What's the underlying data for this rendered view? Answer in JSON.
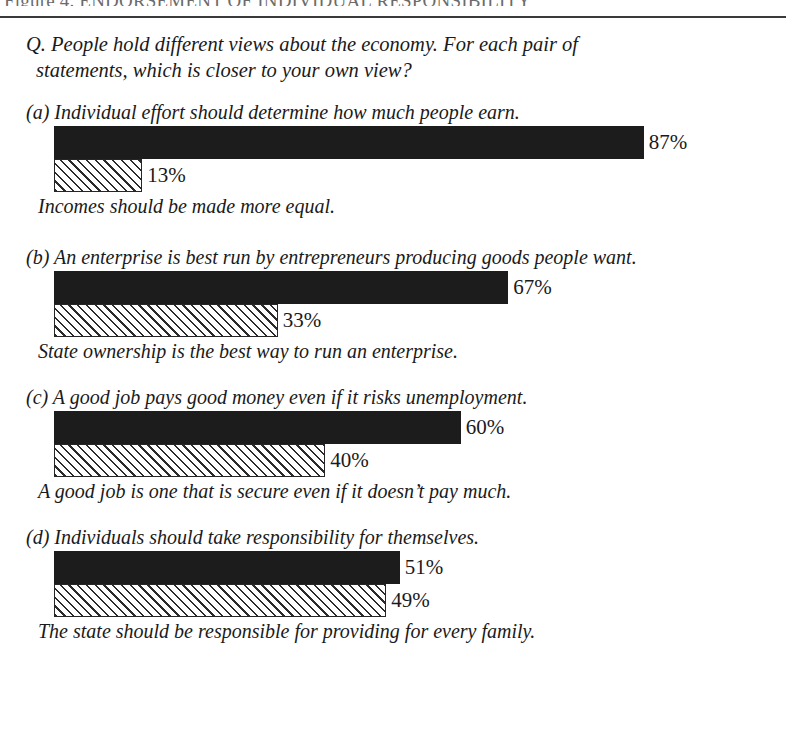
{
  "figure": {
    "title_prefix": "Figure 4.",
    "title": "Figure 4. ENDORSEMENT OF INDIVIDUAL RESPONSIBILITY"
  },
  "question": {
    "line1": "Q. People hold different views about the economy. For each pair of",
    "line2": "statements, which is closer to your own view?"
  },
  "panels": [
    {
      "id": "a",
      "top_statement": "(a) Individual effort should determine how much people earn.",
      "bottom_statement": "Incomes should be made more equal.",
      "top_value": 87,
      "bottom_value": 13,
      "top_label": "87%",
      "bottom_label": "13%"
    },
    {
      "id": "b",
      "top_statement": "(b) An enterprise is best run by entrepreneurs producing goods people want.",
      "bottom_statement": "State ownership is the best way to run an enterprise.",
      "top_value": 67,
      "bottom_value": 33,
      "top_label": "67%",
      "bottom_label": "33%"
    },
    {
      "id": "c",
      "top_statement": "(c) A good job pays good money even if it risks unemployment.",
      "bottom_statement": "A good job is one that is secure even if it doesn’t pay much.",
      "top_value": 60,
      "bottom_value": 40,
      "top_label": "60%",
      "bottom_label": "40%"
    },
    {
      "id": "d",
      "top_statement": "(d) Individuals should take responsibility for themselves.",
      "bottom_statement": "The state should be responsible for providing for every family.",
      "top_value": 51,
      "bottom_value": 49,
      "top_label": "51%",
      "bottom_label": "49%"
    }
  ],
  "chart_data": {
    "type": "bar",
    "title": "Figure 4. ENDORSEMENT OF INDIVIDUAL RESPONSIBILITY",
    "subtitle": "Q. People hold different views about the economy. For each pair of statements, which is closer to your own view?",
    "orientation": "horizontal",
    "xlabel": "",
    "ylabel": "",
    "xlim": [
      0,
      100
    ],
    "grid": false,
    "legend": "none",
    "units": "percent",
    "pixels_per_percent": 6.78,
    "bar_origin_x_px": 54,
    "series": [
      {
        "name": "Individual responsibility statement (solid black bar)",
        "style": "solid-black",
        "categories": [
          "(a)",
          "(b)",
          "(c)",
          "(d)"
        ],
        "values": [
          87,
          67,
          60,
          51
        ],
        "labels": [
          "87%",
          "67%",
          "60%",
          "51%"
        ]
      },
      {
        "name": "State / equality statement (hatched bar)",
        "style": "diagonal-hatch",
        "categories": [
          "(a)",
          "(b)",
          "(c)",
          "(d)"
        ],
        "values": [
          13,
          33,
          40,
          49
        ],
        "labels": [
          "13%",
          "33%",
          "40%",
          "49%"
        ]
      }
    ],
    "pairs": [
      {
        "group": "(a)",
        "top": {
          "text": "Individual effort should determine how much people earn.",
          "value": 87
        },
        "bottom": {
          "text": "Incomes should be made more equal.",
          "value": 13
        }
      },
      {
        "group": "(b)",
        "top": {
          "text": "An enterprise is best run by entrepreneurs producing goods people want.",
          "value": 67
        },
        "bottom": {
          "text": "State ownership is the best way to run an enterprise.",
          "value": 33
        }
      },
      {
        "group": "(c)",
        "top": {
          "text": "A good job pays good money even if it risks unemployment.",
          "value": 60
        },
        "bottom": {
          "text": "A good job is one that is secure even if it doesn’t pay much.",
          "value": 40
        }
      },
      {
        "group": "(d)",
        "top": {
          "text": "Individuals should take responsibility for themselves.",
          "value": 51
        },
        "bottom": {
          "text": "The state should be responsible for providing for every family.",
          "value": 49
        }
      }
    ]
  },
  "colors": {
    "solid_bar": "#1c1c1c",
    "hatch_line": "#2b2b2b",
    "hatch_background": "#ffffff",
    "rule": "#3a3a3a",
    "text": "#1a1a1a",
    "page_background": "#ffffff"
  }
}
